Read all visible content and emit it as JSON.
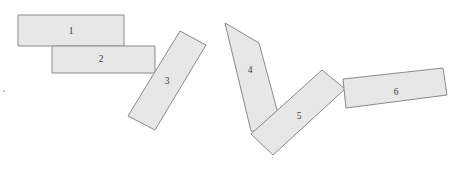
{
  "figure": {
    "background_color": "#ffffff",
    "width": 459,
    "height": 169,
    "shape_fill_color": "#e7e7e7",
    "shape_stroke_color": "#8a8a8a",
    "label_color": "#3a3a3a"
  },
  "shapes": [
    {
      "id": "rect-1",
      "label": "1",
      "label_x": 71,
      "label_y": 32,
      "points": "18,15 124,15 124,46 18,46",
      "rotation_deg": 0
    },
    {
      "id": "rect-2",
      "label": "2",
      "label_x": 101,
      "label_y": 60,
      "points": "52,46 155,46 155,73 52,73",
      "rotation_deg": 0
    },
    {
      "id": "rect-3",
      "label": "3",
      "label_x": 167,
      "label_y": 82,
      "points": "180,31 206,45 155,130 128,116",
      "rotation_deg": 58
    },
    {
      "id": "rect-4",
      "label": "4",
      "label_x": 250,
      "label_y": 71,
      "points": "225,23 259,43 283,132 251,131",
      "rotation_deg": -60
    },
    {
      "id": "rect-5",
      "label": "5",
      "label_x": 299,
      "label_y": 117,
      "points": "322,70 345,89 273,155 251,134",
      "rotation_deg": -41
    },
    {
      "id": "rect-6",
      "label": "6",
      "label_x": 396,
      "label_y": 93,
      "points": "343,79 443,68 447,95 346,108",
      "rotation_deg": -7
    }
  ],
  "specks": [
    {
      "id": "speck-left",
      "x": 4,
      "y": 91,
      "r": 1.1
    }
  ]
}
